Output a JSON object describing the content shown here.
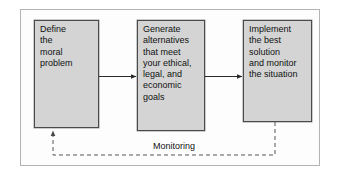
{
  "figure": {
    "type": "process-flow-diagram",
    "background_color": "#ffffff",
    "frame_border_color": "#b3b3b3",
    "box_fill_color": "#d4d4d4",
    "box_border_color": "#4a4a4a",
    "text_color": "#111111",
    "connector_color": "#333333"
  },
  "steps": [
    {
      "id": "define",
      "order": 1,
      "text": "Define\nthe\nmoral\nproblem"
    },
    {
      "id": "generate",
      "order": 2,
      "text": "Generate\nalternatives\nthat meet\nyour ethical,\nlegal, and\neconomic\ngoals"
    },
    {
      "id": "implement",
      "order": 3,
      "text": "Implement\nthe best\nsolution\nand monitor\nthe situation"
    }
  ],
  "feedback": {
    "label": "Monitoring",
    "style": "dashed",
    "from_step": "implement",
    "to_step": "define"
  }
}
